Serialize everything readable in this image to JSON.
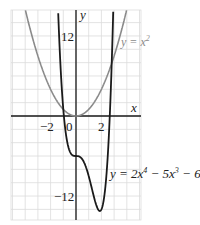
{
  "chart_data": {
    "type": "line",
    "title": "",
    "xlabel": "x",
    "ylabel": "y",
    "xlim": [
      -5,
      5
    ],
    "ylim": [
      -15.6,
      16
    ],
    "grid": true,
    "grid_step": {
      "x": 1,
      "y": 2
    },
    "x_ticks": [
      {
        "value": -2,
        "label": "−2"
      },
      {
        "value": 0,
        "label": "0"
      },
      {
        "value": 2,
        "label": "2"
      }
    ],
    "y_ticks": [
      {
        "value": 12,
        "label": "12"
      },
      {
        "value": -12,
        "label": "−12"
      }
    ],
    "series": [
      {
        "name": "y = x²",
        "expression": "x^2",
        "color": "#8a8a8a",
        "label": {
          "prefix": "y = x",
          "sup": "2"
        }
      },
      {
        "name": "y = 2x⁴ − 5x³ − 6",
        "expression": "2x^4 - 5x^3 - 6",
        "color": "#1a1a1a",
        "label": {
          "prefix": "y = 2x",
          "sup1": "4",
          "mid": " − 5x",
          "sup2": "3",
          "suffix": " − 6"
        }
      }
    ],
    "legend_position": "inline labels"
  },
  "axes": {
    "x_label": "x",
    "y_label": "y"
  },
  "colors": {
    "grid": "#dcdcdc",
    "axis": "#1a1a1a",
    "parabola": "#8a8a8a",
    "quartic": "#1a1a1a"
  }
}
